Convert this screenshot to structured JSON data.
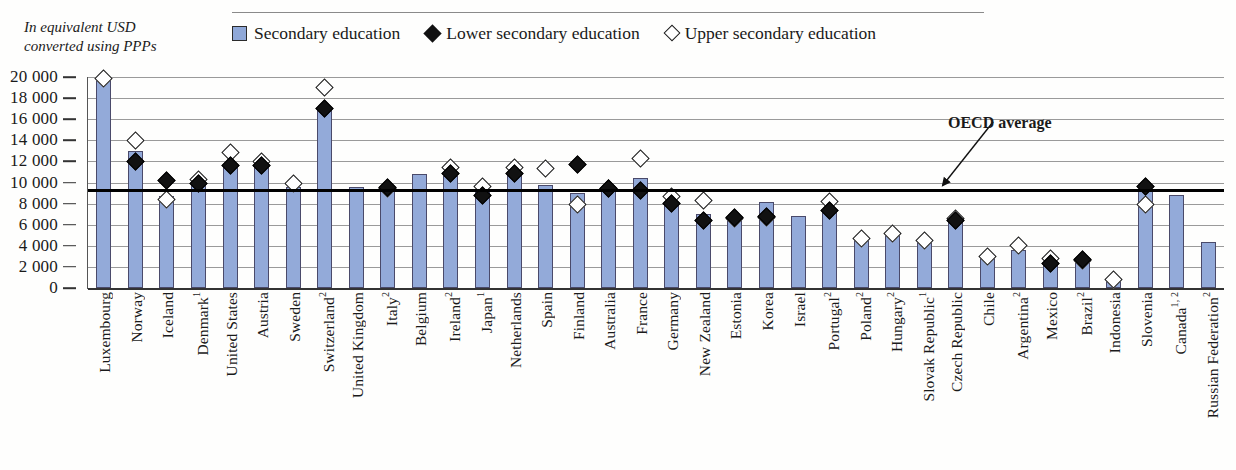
{
  "sidenote": "In equivalent USD converted using PPPs",
  "legend": {
    "items": [
      {
        "label": "Secondary education",
        "marker": "bar-swatch"
      },
      {
        "label": "Lower secondary education",
        "marker": "filled-diamond"
      },
      {
        "label": "Upper secondary education",
        "marker": "open-diamond"
      }
    ]
  },
  "annotation": {
    "oecd_average_label": "OECD average"
  },
  "colors": {
    "bar_fill": "#93aad9",
    "bar_border": "#4a4a6a",
    "lower_marker": "#111111",
    "upper_marker": "#ffffff",
    "oecd_line": "#000000",
    "gridline": "#9a9a9a"
  },
  "chart_data": {
    "type": "bar",
    "title": "",
    "xlabel": "",
    "ylabel": "In equivalent USD converted using PPPs",
    "ylim": [
      0,
      20000
    ],
    "yticks": [
      "0",
      "2 000",
      "4 000",
      "6 000",
      "8 000",
      "10 000",
      "12 000",
      "14 000",
      "16 000",
      "18 000",
      "20 000"
    ],
    "ytick_values": [
      0,
      2000,
      4000,
      6000,
      8000,
      10000,
      12000,
      14000,
      16000,
      18000,
      20000
    ],
    "grid": true,
    "legend_position": "top",
    "oecd_average": 9200,
    "categories": [
      "Luxembourg",
      "Norway",
      "Iceland",
      "Denmark",
      "United States",
      "Austria",
      "Sweden",
      "Switzerland",
      "United Kingdom",
      "Italy",
      "Belgium",
      "Ireland",
      "Japan",
      "Netherlands",
      "Spain",
      "Finland",
      "Australia",
      "France",
      "Germany",
      "New Zealand",
      "Estonia",
      "Korea",
      "Israel",
      "Portugal",
      "Poland",
      "Hungary",
      "Slovak Republic",
      "Czech Republic",
      "Chile",
      "Argentina",
      "Mexico",
      "Brazil",
      "Indonesia",
      "Slovenia",
      "Canada",
      "Russian Federation"
    ],
    "category_footnotes": [
      "",
      "",
      "",
      "1",
      "",
      "",
      "",
      "2",
      "",
      "2",
      "",
      "2",
      "1",
      "",
      "",
      "",
      "",
      "",
      "",
      "",
      "",
      "",
      "",
      "2",
      "2",
      "2",
      "1",
      "",
      "",
      "2",
      "",
      "2",
      "",
      "",
      "1, 2",
      "2"
    ],
    "series": [
      {
        "name": "Secondary education",
        "values": [
          19800,
          13000,
          8700,
          10500,
          11600,
          11500,
          9600,
          17100,
          9600,
          9200,
          10800,
          10600,
          9300,
          10900,
          9800,
          9000,
          9200,
          10400,
          8000,
          7000,
          6700,
          8200,
          6800,
          7200,
          4800,
          5000,
          4400,
          6400,
          2800,
          3600,
          2300,
          2700,
          700,
          9300,
          8800,
          4400
        ]
      },
      {
        "name": "Lower secondary education",
        "values": [
          null,
          12000,
          10200,
          9900,
          11600,
          11600,
          null,
          17000,
          null,
          9500,
          null,
          10900,
          8800,
          10900,
          null,
          11700,
          9400,
          9200,
          8000,
          6400,
          6700,
          6800,
          null,
          7300,
          null,
          null,
          null,
          6400,
          null,
          null,
          2300,
          2700,
          null,
          9600,
          null,
          null
        ]
      },
      {
        "name": "Upper secondary education",
        "values": [
          19900,
          14000,
          8400,
          10300,
          12800,
          12000,
          9900,
          19000,
          null,
          9400,
          null,
          11400,
          9600,
          11400,
          11300,
          7900,
          9400,
          12300,
          8700,
          8300,
          6600,
          6700,
          null,
          8200,
          4700,
          5200,
          4500,
          6600,
          3000,
          4000,
          2800,
          2600,
          800,
          7900,
          null,
          null
        ]
      }
    ]
  }
}
